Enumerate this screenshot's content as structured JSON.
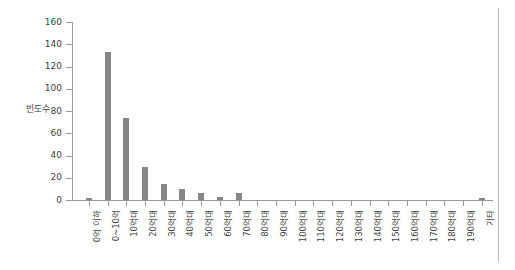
{
  "chart_data": {
    "type": "bar",
    "title": "",
    "subtitle": "",
    "xlabel": "",
    "ylabel": "빈도수",
    "ylim": [
      0,
      160
    ],
    "ytick_values": [
      0,
      20,
      40,
      60,
      80,
      100,
      120,
      140,
      160
    ],
    "ytick_labels": [
      "0",
      "20",
      "40",
      "60",
      "80",
      "100",
      "120",
      "140",
      "160"
    ],
    "grid": false,
    "legend": null,
    "bar_color": "#868686",
    "axis_color": "#9a9a9a",
    "categories": [
      "0억 이하",
      "0~10억",
      "10억대",
      "20억대",
      "30억대",
      "40억대",
      "50억대",
      "60억대",
      "70억대",
      "80억대",
      "90억대",
      "100억대",
      "110억대",
      "120억대",
      "130억대",
      "140억대",
      "150억대",
      "160억대",
      "170억대",
      "180억대",
      "190억대",
      "기타"
    ],
    "values": [
      2,
      133,
      74,
      30,
      14,
      10,
      6,
      3,
      6,
      0,
      0,
      0,
      0,
      0,
      0,
      0,
      0,
      0,
      0,
      0,
      0,
      2
    ]
  }
}
